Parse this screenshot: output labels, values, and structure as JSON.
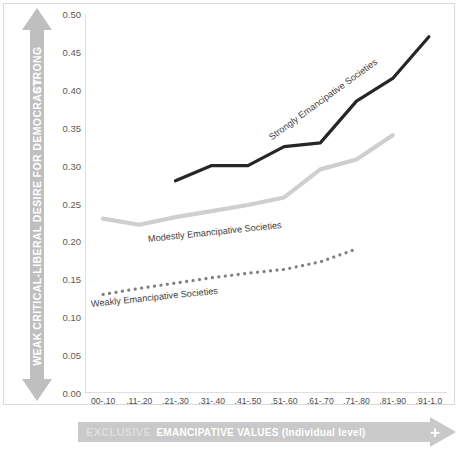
{
  "chart_data": {
    "type": "line",
    "title": "",
    "xlabel": "EMANCIPATIVE VALUES (Individual level)",
    "ylabel": "CRITICAL-LIBERAL DESIRE FOR DEMOCRACY",
    "categories": [
      "00-.10",
      ".11-.20",
      ".21-.30",
      ".31-.40",
      ".41-.50",
      ".51-.60",
      ".61-.70",
      ".71-.80",
      ".81-.90",
      ".91-1.0"
    ],
    "ylim": [
      0.0,
      0.5
    ],
    "ytick_labels": [
      "0.50",
      "0.45",
      "0.40",
      "0.35",
      "0.30",
      "0.25",
      "0.20",
      "0.15",
      "0.10",
      "0.05",
      "0.00"
    ],
    "ytick_values": [
      0.5,
      0.45,
      0.4,
      0.35,
      0.3,
      0.25,
      0.2,
      0.15,
      0.1,
      0.05,
      0.0
    ],
    "grid": false,
    "legend_position": "inline-labels",
    "series": [
      {
        "name": "Strongly Emancipative Societies",
        "style": "solid",
        "color": "#262626",
        "x": [
          ".21-.30",
          ".31-.40",
          ".41-.50",
          ".51-.60",
          ".61-.70",
          ".71-.80",
          ".81-.90",
          ".91-1.0"
        ],
        "values": [
          0.28,
          0.3,
          0.3,
          0.325,
          0.33,
          0.385,
          0.415,
          0.47
        ]
      },
      {
        "name": "Modestly Emancipative Societies",
        "style": "solid",
        "color": "#cfcfcf",
        "x": [
          "00-.10",
          ".11-.20",
          ".21-.30",
          ".31-.40",
          ".41-.50",
          ".51-.60",
          ".61-.70",
          ".71-.80",
          ".81-.90"
        ],
        "values": [
          0.23,
          0.222,
          0.232,
          0.24,
          0.248,
          0.258,
          0.295,
          0.308,
          0.34
        ]
      },
      {
        "name": "Weakly Emancipative Societies",
        "style": "dotted",
        "color": "#808080",
        "x": [
          "00-.10",
          ".11-.20",
          ".21-.30",
          ".31-.40",
          ".41-.50",
          ".51-.60",
          ".61-.70",
          ".71-.80"
        ],
        "values": [
          0.13,
          0.138,
          0.145,
          0.152,
          0.158,
          0.163,
          0.173,
          0.19
        ]
      }
    ],
    "annotations": [
      {
        "text": "Strongly Emancipative Societies"
      },
      {
        "text": "Modestly Emancipative Societies"
      },
      {
        "text": "Weakly Emancipative Societies"
      }
    ]
  },
  "axes": {
    "y_arrow": {
      "top_label": "STRONG",
      "mid_label": "CRITICAL-LIBERAL DESIRE FOR DEMOCRACY",
      "bottom_label": "WEAK",
      "color": "#bfbfbf"
    },
    "x_arrow": {
      "label": "EMANCIPATIVE VALUES (Individual level)",
      "plus": "+",
      "minus": "EXCLUSIVE",
      "color": "#c9c9c9"
    }
  },
  "colors": {
    "strong_line": "#262626",
    "modest_line": "#cfcfcf",
    "weak_line": "#808080",
    "axis": "#bfbfbf",
    "frame": "#d9d9d9"
  }
}
